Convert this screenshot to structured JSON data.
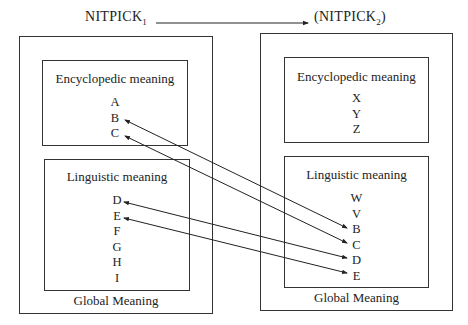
{
  "header": {
    "left_title": "NITPICK",
    "left_subscript": "1",
    "right_title_prefix": "(NITPICK",
    "right_subscript": "2",
    "right_title_suffix": ")"
  },
  "left_concept": {
    "global_label": "Global Meaning",
    "encyclopedic": {
      "label": "Encyclopedic meaning",
      "items": [
        "A",
        "B",
        "C"
      ]
    },
    "linguistic": {
      "label": "Linguistic meaning",
      "items": [
        "D",
        "E",
        "F",
        "G",
        "H",
        "I"
      ]
    }
  },
  "right_concept": {
    "global_label": "Global Meaning",
    "encyclopedic": {
      "label": "Encyclopedic meaning",
      "items": [
        "X",
        "Y",
        "Z"
      ]
    },
    "linguistic": {
      "label": "Linguistic meaning",
      "items": [
        "W",
        "V",
        "B",
        "C",
        "D",
        "E"
      ]
    }
  },
  "connections": [
    {
      "from": "left.encyclopedic.B",
      "to": "right.linguistic.B",
      "type": "double-arrow"
    },
    {
      "from": "left.encyclopedic.C",
      "to": "right.linguistic.C",
      "type": "double-arrow"
    },
    {
      "from": "left.linguistic.D",
      "to": "right.linguistic.D",
      "type": "double-arrow"
    },
    {
      "from": "left.linguistic.E",
      "to": "right.linguistic.E",
      "type": "double-arrow"
    }
  ],
  "header_arrow": {
    "from": "NITPICK1",
    "to": "NITPICK2",
    "type": "single-arrow"
  }
}
